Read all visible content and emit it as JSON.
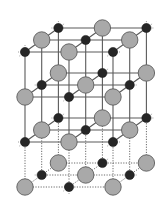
{
  "diagram": {
    "title": "",
    "grid": {
      "columns": 3,
      "depth_rows": 3,
      "layers": 4
    },
    "species": [
      {
        "name": "large-ion",
        "color": "#a9a9a9",
        "outline": "#5c5c5c"
      },
      {
        "name": "small-ion",
        "color": "#262626",
        "outline": "#111111"
      }
    ],
    "bond_color": "#5a5a5a",
    "bottom_layer_style": "dotted",
    "background": "#ffffff"
  }
}
